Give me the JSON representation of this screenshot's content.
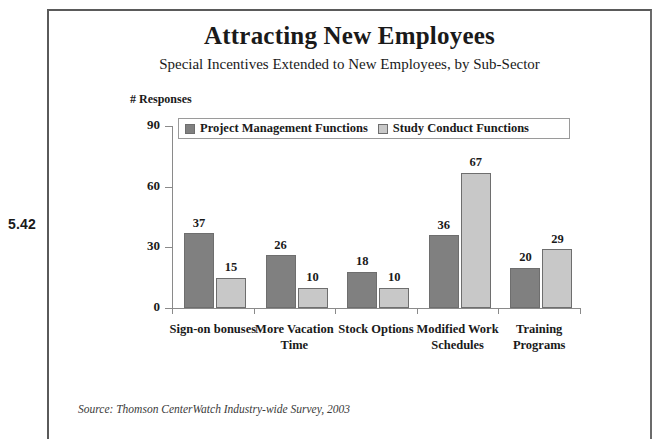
{
  "figure_number": "5.42",
  "title": "Attracting New Employees",
  "subtitle": "Special Incentives Extended to New Employees, by Sub-Sector",
  "source_note": "Source: Thomson CenterWatch Industry-wide Survey, 2003",
  "colors": {
    "series_1": "#808080",
    "series_2": "#c8c8c8",
    "bar_outline": "#6e6e6e",
    "axis": "#8a8a8a",
    "page_border": "#5a5a5a",
    "text": "#1a1a1a"
  },
  "chart_data": {
    "type": "bar",
    "title": "Attracting New Employees",
    "subtitle": "Special Incentives Extended to New Employees, by Sub-Sector",
    "xlabel": "",
    "ylabel": "# Responses",
    "ylim": [
      0,
      90
    ],
    "yticks": [
      0,
      30,
      60,
      90
    ],
    "grid": false,
    "legend_position": "top-inside",
    "categories": [
      "Sign-on bonuses",
      "More Vacation Time",
      "Stock Options",
      "Modified Work Schedules",
      "Training Programs"
    ],
    "series": [
      {
        "name": "Project Management Functions",
        "color": "#808080",
        "values": [
          37,
          26,
          18,
          36,
          20
        ]
      },
      {
        "name": "Study Conduct Functions",
        "color": "#c8c8c8",
        "values": [
          15,
          10,
          10,
          67,
          29
        ]
      }
    ]
  }
}
